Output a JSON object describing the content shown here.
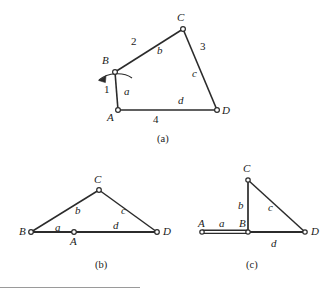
{
  "figure": {
    "background_color": "#ffffff",
    "line_color": "#2b2b2b",
    "joint_fill": "#ffffff",
    "panels": [
      {
        "id": "a",
        "caption": "(a)",
        "kind": "four-bar-linkage-general-position",
        "vertex_labels": [
          "A",
          "B",
          "C",
          "D"
        ],
        "link_letter_labels": [
          "a",
          "b",
          "c",
          "d"
        ],
        "link_number_labels": [
          "1",
          "2",
          "3",
          "4"
        ],
        "has_rotation_arrow": true
      },
      {
        "id": "b",
        "caption": "(b)",
        "kind": "linkage-flattened-triangle",
        "vertex_labels": [
          "A",
          "B",
          "C",
          "D"
        ],
        "link_letter_labels": [
          "a",
          "b",
          "c",
          "d"
        ]
      },
      {
        "id": "c",
        "caption": "(c)",
        "kind": "linkage-folded-right-triangle",
        "vertex_labels": [
          "A",
          "B",
          "C",
          "D"
        ],
        "link_letter_labels": [
          "a",
          "b",
          "c",
          "d"
        ]
      }
    ]
  },
  "panel_a": {
    "caption": "(a)",
    "labels": {
      "vertex_A": "A",
      "vertex_B": "B",
      "vertex_C": "C",
      "vertex_D": "D",
      "link_a": "a",
      "link_b": "b",
      "link_c": "c",
      "link_d": "d",
      "num_1": "1",
      "num_2": "2",
      "num_3": "3",
      "num_4": "4"
    }
  },
  "panel_b": {
    "caption": "(b)",
    "labels": {
      "vertex_A": "A",
      "vertex_B": "B",
      "vertex_C": "C",
      "vertex_D": "D",
      "link_a": "a",
      "link_b": "b",
      "link_c": "c",
      "link_d": "d"
    }
  },
  "panel_c": {
    "caption": "(c)",
    "labels": {
      "vertex_A": "A",
      "vertex_B": "B",
      "vertex_C": "C",
      "vertex_D": "D",
      "link_a": "a",
      "link_b": "b",
      "link_c": "c",
      "link_d": "d"
    }
  }
}
